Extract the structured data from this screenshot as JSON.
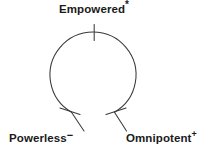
{
  "diagram": {
    "background_color": "#ffffff",
    "stroke_color": "#3a3a3a",
    "text_color": "#1a1a1a",
    "nodes": [
      {
        "id": "empowered",
        "label": "Empowered",
        "superscript": "*",
        "position": "top"
      },
      {
        "id": "powerless",
        "label": "Powerless",
        "superscript": "−",
        "position": "bottom-left"
      },
      {
        "id": "omnipotent",
        "label": "Omnipotent",
        "superscript": "+",
        "position": "bottom-right"
      }
    ],
    "arc": {
      "shape": "open-circle",
      "center_x": 93,
      "center_y": 75,
      "radius": 43,
      "gap_position": "bottom",
      "gap_degrees": 70,
      "stroke_width": 1
    },
    "ticks": [
      {
        "id": "tick-top",
        "at_node": "empowered",
        "orientation": "vertical"
      },
      {
        "id": "tick-left-end",
        "at_node": "powerless",
        "orientation": "diagonal"
      },
      {
        "id": "tick-right-end",
        "at_node": "omnipotent",
        "orientation": "diagonal"
      }
    ]
  }
}
